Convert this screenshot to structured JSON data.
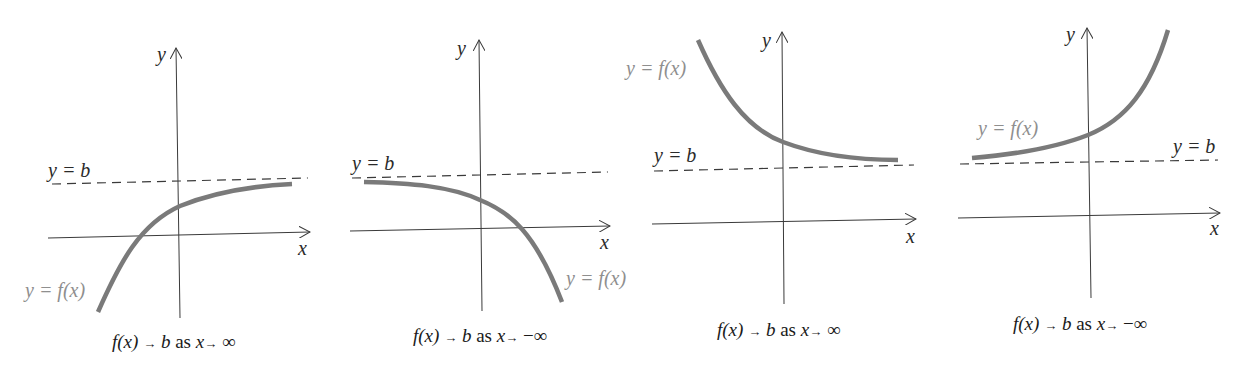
{
  "colors": {
    "axis": "#3a3a3a",
    "asymptote": "#3a3a3a",
    "curve": "#7a7a7a",
    "curve_label": "#8f8f8f",
    "text": "#1a1a1a"
  },
  "panels": [
    {
      "axis_x_label": "x",
      "axis_y_label": "y",
      "asymptote_label": "y = b",
      "curve_label": "y = f(x)",
      "caption": {
        "func": "f(x)",
        "arrow1": "→",
        "b": "b",
        "as": "as",
        "x": "x",
        "arrow2": "→",
        "limit": "∞"
      },
      "behavior": "increasing, approaches b from below as x → ∞"
    },
    {
      "axis_x_label": "x",
      "axis_y_label": "y",
      "asymptote_label": "y = b",
      "curve_label": "y = f(x)",
      "caption": {
        "func": "f(x)",
        "arrow1": "→",
        "b": "b",
        "as": "as",
        "x": "x",
        "arrow2": "→",
        "limit": "−∞"
      },
      "behavior": "decreasing, approaches b from below as x → −∞"
    },
    {
      "axis_x_label": "x",
      "axis_y_label": "y",
      "asymptote_label": "y = b",
      "curve_label": "y = f(x)",
      "caption": {
        "func": "f(x)",
        "arrow1": "→",
        "b": "b",
        "as": "as",
        "x": "x",
        "arrow2": "→",
        "limit": "∞"
      },
      "behavior": "decreasing, approaches b from above as x → ∞"
    },
    {
      "axis_x_label": "x",
      "axis_y_label": "y",
      "asymptote_label": "y = b",
      "curve_label": "y = f(x)",
      "caption": {
        "func": "f(x)",
        "arrow1": "→",
        "b": "b",
        "as": "as",
        "x": "x",
        "arrow2": "→",
        "limit": "−∞"
      },
      "behavior": "increasing, approaches b from above as x → −∞"
    }
  ]
}
